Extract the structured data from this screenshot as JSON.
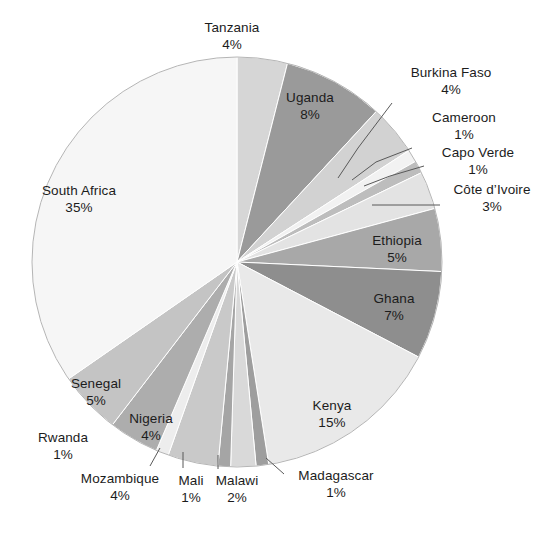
{
  "chart_data": {
    "type": "pie",
    "title": "",
    "subtitle": "",
    "xlabel": "",
    "ylabel": "",
    "legend_position": "none",
    "grid": false,
    "units": "percent",
    "start_angle_deg": 0,
    "direction": "clockwise",
    "center": {
      "x": 237,
      "y": 262
    },
    "radius": 205,
    "categories": [
      "Tanzania",
      "Uganda",
      "Burkina Faso",
      "Cameroon",
      "Capo Verde",
      "Côte d’Ivoire",
      "Ethiopia",
      "Ghana",
      "Kenya",
      "Madagascar",
      "Malawi",
      "Mali",
      "Mozambique",
      "Rwanda",
      "Nigeria",
      "Senegal",
      "South Africa"
    ],
    "values": [
      4,
      8,
      4,
      1,
      1,
      3,
      5,
      7,
      15,
      1,
      2,
      1,
      4,
      1,
      4,
      5,
      35
    ],
    "value_labels": [
      "4%",
      "8%",
      "4%",
      "1%",
      "1%",
      "3%",
      "5%",
      "7%",
      "15%",
      "1%",
      "2%",
      "1%",
      "4%",
      "1%",
      "4%",
      "5%",
      "35%"
    ],
    "slice_colors": [
      "#d6d6d6",
      "#9a9a9a",
      "#d2d2d2",
      "#f2f2f2",
      "#bdbdbd",
      "#e3e3e3",
      "#a8a8a8",
      "#8e8e8e",
      "#e9e9e9",
      "#9e9e9e",
      "#d9d9d9",
      "#a5a5a5",
      "#c9c9c9",
      "#ededed",
      "#adadad",
      "#c4c4c4",
      "#f6f6f6"
    ]
  },
  "slices": [
    {
      "name": "Tanzania",
      "value_label": "4%",
      "label_x": 232,
      "label_y": 20,
      "leader": false
    },
    {
      "name": "Uganda",
      "value_label": "8%",
      "label_x": 310,
      "label_y": 90,
      "leader": false
    },
    {
      "name": "Burkina Faso",
      "value_label": "4%",
      "label_x": 451,
      "label_y": 65,
      "leader": true,
      "leader_points": "338,178 358,148 392,103"
    },
    {
      "name": "Cameroon",
      "value_label": "1%",
      "label_x": 464,
      "label_y": 110,
      "leader": true,
      "leader_points": "352,180 376,162 412,148"
    },
    {
      "name": "Capo Verde",
      "value_label": "1%",
      "label_x": 478,
      "label_y": 145,
      "leader": true,
      "leader_points": "364,186 390,176 424,166"
    },
    {
      "name": "Côte d’Ivoire",
      "value_label": "3%",
      "label_x": 492,
      "label_y": 182,
      "leader": true,
      "leader_points": "372,205 440,205"
    },
    {
      "name": "Ethiopia",
      "value_label": "5%",
      "label_x": 397,
      "label_y": 233,
      "leader": false
    },
    {
      "name": "Ghana",
      "value_label": "7%",
      "label_x": 394,
      "label_y": 291,
      "leader": false
    },
    {
      "name": "Kenya",
      "value_label": "15%",
      "label_x": 332,
      "label_y": 398,
      "leader": false
    },
    {
      "name": "Madagascar",
      "value_label": "1%",
      "label_x": 336,
      "label_y": 468,
      "leader": true,
      "leader_points": "266,458 284,474"
    },
    {
      "name": "Malawi",
      "value_label": "2%",
      "label_x": 237,
      "label_y": 473,
      "leader": true,
      "leader_points": "218,455 218,469"
    },
    {
      "name": "Mali",
      "value_label": "1%",
      "label_x": 191,
      "label_y": 473,
      "leader": true,
      "leader_points": "183,452 183,468"
    },
    {
      "name": "Mozambique",
      "value_label": "4%",
      "label_x": 120,
      "label_y": 471,
      "leader": true,
      "leader_points": "160,448 150,466"
    },
    {
      "name": "Rwanda",
      "value_label": "1%",
      "label_x": 63,
      "label_y": 430,
      "leader": false
    },
    {
      "name": "Nigeria",
      "value_label": "4%",
      "label_x": 151,
      "label_y": 411,
      "leader": false
    },
    {
      "name": "Senegal",
      "value_label": "5%",
      "label_x": 96,
      "label_y": 376,
      "leader": false
    },
    {
      "name": "South Africa",
      "value_label": "35%",
      "label_x": 79,
      "label_y": 183,
      "leader": false
    }
  ],
  "footer": {
    "cut_text": ""
  }
}
